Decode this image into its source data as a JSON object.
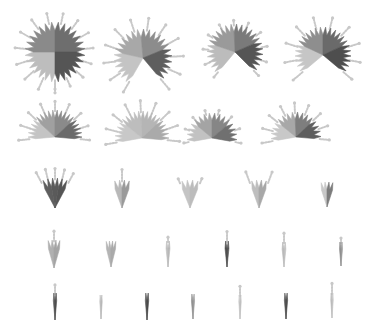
{
  "chart_data": {
    "type": "glyph-grid",
    "title": "",
    "grid": false,
    "legend": null,
    "rows": [
      {
        "row": 1,
        "glyphs": [
          {
            "cx": 55,
            "cy": 52,
            "r": 30,
            "start": -180,
            "end": 180,
            "spikes": 28,
            "tones": [
              "#bdbdbd",
              "#8a8a8a",
              "#6e6e6e",
              "#555555"
            ],
            "whiskers": 16
          },
          {
            "cx": 143,
            "cy": 58,
            "r": 29,
            "start": -150,
            "end": 140,
            "spikes": 24,
            "tones": [
              "#c4c4c4",
              "#a8a8a8",
              "#8c8c8c",
              "#5e5e5e"
            ],
            "whiskers": 12
          },
          {
            "cx": 235,
            "cy": 52,
            "r": 28,
            "start": -140,
            "end": 135,
            "spikes": 22,
            "tones": [
              "#bcbcbc",
              "#9a9a9a",
              "#7a7a7a",
              "#555555"
            ],
            "whiskers": 11
          },
          {
            "cx": 323,
            "cy": 55,
            "r": 28,
            "start": -130,
            "end": 130,
            "spikes": 22,
            "tones": [
              "#c6c6c6",
              "#8e8e8e",
              "#6a6a6a",
              "#4e4e4e"
            ],
            "whiskers": 10
          }
        ]
      },
      {
        "row": 2,
        "glyphs": [
          {
            "cx": 55,
            "cy": 137,
            "r": 27,
            "start": -95,
            "end": 95,
            "spikes": 18,
            "tones": [
              "#c4c4c4",
              "#a0a0a0",
              "#8a8a8a",
              "#6a6a6a"
            ],
            "whiskers": 9
          },
          {
            "cx": 142,
            "cy": 138,
            "r": 27,
            "start": -100,
            "end": 95,
            "spikes": 18,
            "tones": [
              "#c8c8c8",
              "#bdbdbd",
              "#b5b5b5",
              "#aaaaaa"
            ],
            "whiskers": 9
          },
          {
            "cx": 212,
            "cy": 138,
            "r": 25,
            "start": -100,
            "end": 100,
            "spikes": 16,
            "tones": [
              "#c2c2c2",
              "#a4a4a4",
              "#868686",
              "#707070"
            ],
            "whiskers": 8
          },
          {
            "cx": 296,
            "cy": 137,
            "r": 25,
            "start": -100,
            "end": 95,
            "spikes": 16,
            "tones": [
              "#c8c8c8",
              "#a8a8a8",
              "#7e7e7e",
              "#5e5e5e"
            ],
            "whiskers": 9
          }
        ]
      },
      {
        "row": 3,
        "glyphs": [
          {
            "cx": 55,
            "cy": 208,
            "r": 30,
            "start": -28,
            "end": 28,
            "spikes": 5,
            "tones": [
              "#5e5e5e",
              "#5a5a5a",
              "#555555"
            ],
            "whiskers": 5
          },
          {
            "cx": 122,
            "cy": 208,
            "r": 28,
            "start": -20,
            "end": 20,
            "spikes": 4,
            "tones": [
              "#b8b8b8",
              "#9a9a9a"
            ],
            "whiskers": 1
          },
          {
            "cx": 190,
            "cy": 208,
            "r": 28,
            "start": -22,
            "end": 22,
            "spikes": 4,
            "tones": [
              "#c4c4c4",
              "#bcbcbc"
            ],
            "whiskers": 2
          },
          {
            "cx": 259,
            "cy": 208,
            "r": 28,
            "start": -20,
            "end": 20,
            "spikes": 4,
            "tones": [
              "#bebebe",
              "#a8a8a8"
            ],
            "whiskers": 2
          },
          {
            "cx": 327,
            "cy": 207,
            "r": 25,
            "start": -18,
            "end": 18,
            "spikes": 4,
            "tones": [
              "#c8c8c8",
              "#7c7c7c"
            ],
            "whiskers": 0
          }
        ]
      },
      {
        "row": 4,
        "glyphs": [
          {
            "cx": 54,
            "cy": 268,
            "r": 28,
            "start": -16,
            "end": 16,
            "spikes": 3,
            "tones": [
              "#b0b0b0",
              "#a4a4a4"
            ],
            "whiskers": 1
          },
          {
            "cx": 111,
            "cy": 267,
            "r": 26,
            "start": -14,
            "end": 14,
            "spikes": 3,
            "tones": [
              "#b4b4b4",
              "#aaaaaa"
            ],
            "whiskers": 0
          },
          {
            "cx": 168,
            "cy": 267,
            "r": 26,
            "start": -6,
            "end": 6,
            "spikes": 2,
            "tones": [
              "#c0c0c0",
              "#b8b8b8"
            ],
            "whiskers": 1
          },
          {
            "cx": 227,
            "cy": 267,
            "r": 26,
            "start": -6,
            "end": 6,
            "spikes": 2,
            "tones": [
              "#4e4e4e",
              "#555555"
            ],
            "whiskers": 1
          },
          {
            "cx": 284,
            "cy": 267,
            "r": 25,
            "start": -6,
            "end": 6,
            "spikes": 2,
            "tones": [
              "#b8b8b8",
              "#c0c0c0"
            ],
            "whiskers": 1
          },
          {
            "cx": 341,
            "cy": 266,
            "r": 24,
            "start": -5,
            "end": 5,
            "spikes": 2,
            "tones": [
              "#8a8a8a",
              "#9a9a9a"
            ],
            "whiskers": 1
          }
        ]
      },
      {
        "row": 5,
        "glyphs": [
          {
            "cx": 55,
            "cy": 320,
            "r": 27,
            "start": -5,
            "end": 5,
            "spikes": 2,
            "tones": [
              "#5a5a5a",
              "#4e4e4e"
            ],
            "whiskers": 1
          },
          {
            "cx": 101,
            "cy": 319,
            "r": 24,
            "start": -4,
            "end": 4,
            "spikes": 2,
            "tones": [
              "#c0c0c0",
              "#b8b8b8"
            ],
            "whiskers": 0
          },
          {
            "cx": 147,
            "cy": 320,
            "r": 27,
            "start": -5,
            "end": 5,
            "spikes": 2,
            "tones": [
              "#555555",
              "#4a4a4a"
            ],
            "whiskers": 0
          },
          {
            "cx": 193,
            "cy": 319,
            "r": 25,
            "start": -5,
            "end": 5,
            "spikes": 2,
            "tones": [
              "#8e8e8e",
              "#9a9a9a"
            ],
            "whiskers": 0
          },
          {
            "cx": 240,
            "cy": 319,
            "r": 24,
            "start": -4,
            "end": 4,
            "spikes": 2,
            "tones": [
              "#c8c8c8",
              "#c0c0c0"
            ],
            "whiskers": 1
          },
          {
            "cx": 286,
            "cy": 319,
            "r": 26,
            "start": -5,
            "end": 5,
            "spikes": 2,
            "tones": [
              "#555555",
              "#4e4e4e"
            ],
            "whiskers": 0
          },
          {
            "cx": 332,
            "cy": 318,
            "r": 25,
            "start": -4,
            "end": 4,
            "spikes": 2,
            "tones": [
              "#b8b8b8",
              "#c4c4c4"
            ],
            "whiskers": 1
          }
        ]
      }
    ]
  },
  "colors": {
    "background": "#ffffff",
    "whisker": "#c8c8c8"
  }
}
